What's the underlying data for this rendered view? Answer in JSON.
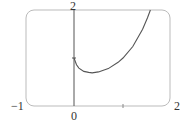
{
  "chart_data": {
    "type": "line",
    "title": "",
    "xlabel": "",
    "ylabel": "",
    "xlim": [
      -1,
      2
    ],
    "ylim": [
      0,
      2
    ],
    "grid": false,
    "legend": null,
    "tick_labels": {
      "x": [
        "-1",
        "0",
        "2"
      ],
      "y": [
        "2"
      ]
    },
    "series": [
      {
        "name": "f(x) = x^x",
        "x": [
          0.0,
          0.05,
          0.1,
          0.2,
          0.3,
          0.37,
          0.5,
          0.7,
          0.9,
          1.0,
          1.2,
          1.4,
          1.5,
          1.56
        ],
        "y": [
          1.0,
          0.86,
          0.79,
          0.72,
          0.7,
          0.69,
          0.71,
          0.78,
          0.91,
          1.0,
          1.24,
          1.6,
          1.84,
          2.0
        ]
      }
    ],
    "annotations": [
      "tick at y=1 on y-axis",
      "tick at x=1 on x-axis"
    ]
  },
  "labels": {
    "y_top": "2",
    "x_left": "−1",
    "x_origin": "0",
    "x_right": "2"
  },
  "colors": {
    "frame": "#bbbbbb",
    "axis": "#555555",
    "curve": "#555555",
    "text": "#333333"
  }
}
